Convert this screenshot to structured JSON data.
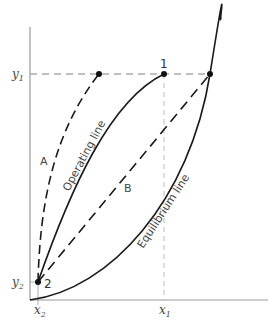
{
  "diagram": {
    "type": "operating-equilibrium-line-diagram",
    "axes": {
      "y_labels": {
        "y1": "y",
        "y1_sub": "1",
        "y2": "y",
        "y2_sub": "2"
      },
      "x_labels": {
        "x2": "x",
        "x2_sub": "2",
        "x1": "x",
        "x1_sub": "1"
      }
    },
    "points": {
      "p1": "1",
      "p2": "2"
    },
    "curves": {
      "A": "A",
      "B": "B",
      "operating": "Operating line",
      "equilibrium": "Equilibrium line"
    },
    "colors": {
      "line": "#1a1a1a",
      "axis": "#999999",
      "guide": "#aaaaaa"
    }
  }
}
